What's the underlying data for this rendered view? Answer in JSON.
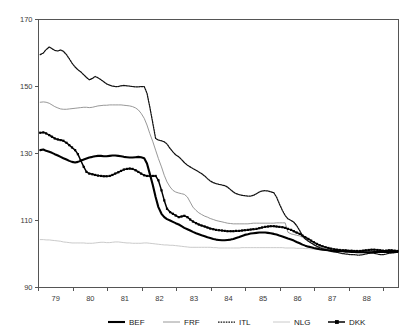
{
  "chart_data": {
    "type": "line",
    "title": "",
    "subtitle": "",
    "xlabel": "",
    "ylabel": "",
    "xlim": [
      78.5,
      88.92
    ],
    "ylim": [
      90,
      170
    ],
    "grid": false,
    "legend_position": "bottom",
    "y_ticks": [
      90,
      110,
      130,
      150,
      170
    ],
    "y_tick_labels": [
      "90",
      "110",
      "130",
      "150",
      "170"
    ],
    "x_ticks": [
      78.5,
      79.5,
      80.5,
      81.5,
      82.5,
      83.5,
      84.5,
      85.5,
      86.5,
      87.5,
      88.5
    ],
    "x_tick_labels": [
      "79",
      "80",
      "81",
      "82",
      "83",
      "84",
      "85",
      "86",
      "87",
      "88"
    ],
    "x": [
      78.55,
      78.64,
      78.72,
      78.81,
      78.89,
      78.97,
      79.06,
      79.14,
      79.22,
      79.31,
      79.39,
      79.47,
      79.56,
      79.64,
      79.72,
      79.81,
      79.89,
      79.97,
      80.06,
      80.14,
      80.22,
      80.31,
      80.39,
      80.47,
      80.56,
      80.64,
      80.72,
      80.81,
      80.89,
      80.97,
      81.06,
      81.14,
      81.22,
      81.31,
      81.39,
      81.47,
      81.56,
      81.64,
      81.72,
      81.81,
      81.89,
      81.97,
      82.06,
      82.14,
      82.22,
      82.31,
      82.39,
      82.47,
      82.56,
      82.64,
      82.72,
      82.81,
      82.89,
      82.97,
      83.06,
      83.14,
      83.22,
      83.31,
      83.39,
      83.47,
      83.56,
      83.64,
      83.72,
      83.81,
      83.89,
      83.97,
      84.06,
      84.14,
      84.22,
      84.31,
      84.39,
      84.47,
      84.56,
      84.64,
      84.72,
      84.81,
      84.89,
      84.97,
      85.06,
      85.14,
      85.22,
      85.31,
      85.39,
      85.47,
      85.56,
      85.64,
      85.72,
      85.81,
      85.89,
      85.97,
      86.06,
      86.14,
      86.22,
      86.31,
      86.39,
      86.47,
      86.56,
      86.64,
      86.72,
      86.81,
      86.89,
      86.97,
      87.06,
      87.14,
      87.22,
      87.31,
      87.39,
      87.47,
      87.56,
      87.64,
      87.72,
      87.81,
      87.89,
      87.97,
      88.06,
      88.14,
      88.22,
      88.31,
      88.39,
      88.47,
      88.56,
      88.64,
      88.72,
      88.81,
      88.89
    ],
    "series": [
      {
        "name": "BEF",
        "style": "solid-thick",
        "color": "#000000",
        "values": [
          131.0,
          131.2,
          130.8,
          130.5,
          130.2,
          129.8,
          129.4,
          129.0,
          128.6,
          128.2,
          127.8,
          127.5,
          127.3,
          127.5,
          127.8,
          128.2,
          128.5,
          128.8,
          129.0,
          129.2,
          129.3,
          129.3,
          129.2,
          129.2,
          129.3,
          129.4,
          129.4,
          129.3,
          129.2,
          129.0,
          128.9,
          128.8,
          128.8,
          128.9,
          129.0,
          128.9,
          128.6,
          127.0,
          124.0,
          120.5,
          117.0,
          114.0,
          112.0,
          111.0,
          110.4,
          110.0,
          109.6,
          109.2,
          108.8,
          108.3,
          107.8,
          107.4,
          107.0,
          106.6,
          106.2,
          105.9,
          105.6,
          105.3,
          105.0,
          104.8,
          104.5,
          104.3,
          104.2,
          104.1,
          104.1,
          104.2,
          104.3,
          104.5,
          104.8,
          105.1,
          105.4,
          105.7,
          105.9,
          106.1,
          106.2,
          106.3,
          106.4,
          106.4,
          106.4,
          106.3,
          106.2,
          106.0,
          105.8,
          105.5,
          105.2,
          104.9,
          104.6,
          104.3,
          104.0,
          103.6,
          103.2,
          102.8,
          102.5,
          102.2,
          102.0,
          101.8,
          101.6,
          101.4,
          101.3,
          101.2,
          101.1,
          101.0,
          100.9,
          100.9,
          100.8,
          100.8,
          100.7,
          100.7,
          100.6,
          100.6,
          100.5,
          100.5,
          100.5,
          100.5,
          100.5,
          100.5,
          100.6,
          100.6,
          100.6,
          100.6,
          100.6,
          100.6,
          100.6,
          100.6,
          100.6
        ]
      },
      {
        "name": "FRF",
        "style": "solid-medium",
        "color": "#8c8c8c",
        "values": [
          145.3,
          145.4,
          145.3,
          145.0,
          144.5,
          144.0,
          143.6,
          143.3,
          143.2,
          143.2,
          143.3,
          143.4,
          143.5,
          143.6,
          143.7,
          143.8,
          143.8,
          143.7,
          143.8,
          144.0,
          144.2,
          144.3,
          144.4,
          144.4,
          144.5,
          144.5,
          144.5,
          144.5,
          144.5,
          144.4,
          144.3,
          144.2,
          144.0,
          143.6,
          143.0,
          142.0,
          140.5,
          138.5,
          136.0,
          133.5,
          131.0,
          128.5,
          126.0,
          123.5,
          121.5,
          120.0,
          119.0,
          118.5,
          118.2,
          118.0,
          117.8,
          117.0,
          115.5,
          114.0,
          113.0,
          112.3,
          111.8,
          111.3,
          111.0,
          110.6,
          110.3,
          110.0,
          109.8,
          109.6,
          109.4,
          109.2,
          109.1,
          109.0,
          109.0,
          109.0,
          109.0,
          109.0,
          109.0,
          109.1,
          109.2,
          109.2,
          109.2,
          109.2,
          109.2,
          109.2,
          109.2,
          109.2,
          109.3,
          109.3,
          109.3,
          109.3,
          106.5,
          106.0,
          105.8,
          105.6,
          105.4,
          105.0,
          104.5,
          104.0,
          103.3,
          102.7,
          102.2,
          101.9,
          101.7,
          101.5,
          101.3,
          101.2,
          101.1,
          101.0,
          101.0,
          100.9,
          100.9,
          100.8,
          100.8,
          100.8,
          100.7,
          100.7,
          100.7,
          100.7,
          100.7,
          100.7,
          100.7,
          100.7,
          100.7,
          100.7,
          100.7,
          100.7,
          100.7,
          100.7,
          100.7
        ]
      },
      {
        "name": "ITL",
        "style": "dotted",
        "color": "#111111",
        "values": [
          159.5,
          160.0,
          161.0,
          161.8,
          161.3,
          160.8,
          160.6,
          160.9,
          160.5,
          159.5,
          158.3,
          157.0,
          155.8,
          155.0,
          154.4,
          153.5,
          152.7,
          152.0,
          152.4,
          153.0,
          152.6,
          152.0,
          151.4,
          150.8,
          150.4,
          150.1,
          150.0,
          150.0,
          150.2,
          150.3,
          150.2,
          150.1,
          150.0,
          149.9,
          149.9,
          150.0,
          150.0,
          148.0,
          144.0,
          139.0,
          134.5,
          134.0,
          133.8,
          133.5,
          132.8,
          131.5,
          130.5,
          129.6,
          129.0,
          128.2,
          127.3,
          126.5,
          126.0,
          125.5,
          125.0,
          124.5,
          124.0,
          123.3,
          122.5,
          121.8,
          121.3,
          121.0,
          120.8,
          120.6,
          120.4,
          120.0,
          119.2,
          118.5,
          118.0,
          117.7,
          117.5,
          117.4,
          117.3,
          117.3,
          117.5,
          118.0,
          118.5,
          118.8,
          118.9,
          118.8,
          118.6,
          118.3,
          117.0,
          115.0,
          113.0,
          111.5,
          110.5,
          110.0,
          109.5,
          108.5,
          107.0,
          105.5,
          104.5,
          103.8,
          103.3,
          102.8,
          102.3,
          101.9,
          101.5,
          101.2,
          101.0,
          100.8,
          100.6,
          100.5,
          100.3,
          100.1,
          100.0,
          99.9,
          99.8,
          99.8,
          99.7,
          99.7,
          99.8,
          100.0,
          100.2,
          100.3,
          100.2,
          100.0,
          99.8,
          99.8,
          100.0,
          100.2,
          100.3,
          100.4,
          100.5
        ]
      },
      {
        "name": "NLG",
        "style": "solid-light",
        "color": "#c4c4c4",
        "values": [
          104.3,
          104.3,
          104.2,
          104.2,
          104.1,
          104.0,
          103.9,
          103.8,
          103.6,
          103.5,
          103.4,
          103.3,
          103.3,
          103.3,
          103.3,
          103.3,
          103.2,
          103.2,
          103.2,
          103.3,
          103.4,
          103.5,
          103.5,
          103.4,
          103.4,
          103.5,
          103.6,
          103.6,
          103.5,
          103.4,
          103.3,
          103.3,
          103.2,
          103.2,
          103.2,
          103.2,
          103.3,
          103.3,
          103.2,
          103.1,
          103.0,
          102.9,
          102.8,
          102.7,
          102.7,
          102.6,
          102.6,
          102.5,
          102.4,
          102.3,
          102.2,
          102.1,
          102.0,
          102.0,
          102.0,
          102.0,
          102.0,
          102.0,
          102.0,
          102.0,
          101.9,
          101.9,
          101.8,
          101.8,
          101.8,
          101.8,
          101.8,
          101.8,
          101.8,
          101.8,
          101.9,
          101.9,
          101.9,
          101.9,
          101.9,
          101.9,
          101.9,
          101.9,
          101.9,
          101.9,
          101.9,
          101.9,
          101.9,
          101.9,
          101.9,
          101.8,
          101.8,
          101.8,
          101.8,
          101.7,
          101.7,
          101.7,
          101.6,
          101.6,
          101.5,
          101.4,
          101.4,
          101.3,
          101.3,
          101.2,
          101.2,
          101.1,
          101.1,
          101.0,
          101.0,
          100.9,
          100.9,
          100.9,
          100.8,
          100.8,
          100.8,
          100.8,
          100.8,
          100.8,
          100.8,
          100.8,
          100.8,
          100.8,
          100.8,
          100.8,
          100.8,
          100.8,
          100.8,
          100.8,
          100.8
        ]
      },
      {
        "name": "DKK",
        "style": "marker-square",
        "color": "#000000",
        "values": [
          136.2,
          136.3,
          136.0,
          135.5,
          135.0,
          134.5,
          134.2,
          134.0,
          133.8,
          133.2,
          132.5,
          131.8,
          131.0,
          129.8,
          128.0,
          126.0,
          124.5,
          124.0,
          123.8,
          123.6,
          123.4,
          123.3,
          123.2,
          123.2,
          123.3,
          123.6,
          124.0,
          124.4,
          124.8,
          125.2,
          125.4,
          125.5,
          125.4,
          125.0,
          124.5,
          124.0,
          123.5,
          123.3,
          123.3,
          123.3,
          123.3,
          122.0,
          119.0,
          116.0,
          113.5,
          112.5,
          112.0,
          111.5,
          111.0,
          111.2,
          111.4,
          111.0,
          110.3,
          109.7,
          109.2,
          108.8,
          108.5,
          108.2,
          107.9,
          107.6,
          107.4,
          107.2,
          107.1,
          107.0,
          106.9,
          106.8,
          106.8,
          106.8,
          106.9,
          106.9,
          107.0,
          107.1,
          107.2,
          107.3,
          107.4,
          107.5,
          107.7,
          107.9,
          108.1,
          108.2,
          108.3,
          108.3,
          108.2,
          108.1,
          108.0,
          107.8,
          107.5,
          107.2,
          106.8,
          106.4,
          106.0,
          105.5,
          105.0,
          104.5,
          104.0,
          103.5,
          103.0,
          102.6,
          102.3,
          102.0,
          101.8,
          101.6,
          101.4,
          101.3,
          101.2,
          101.1,
          101.1,
          101.0,
          101.0,
          100.9,
          100.9,
          100.9,
          101.0,
          101.1,
          101.2,
          101.3,
          101.3,
          101.2,
          101.1,
          101.0,
          101.0,
          101.1,
          101.1,
          101.0,
          100.9
        ]
      }
    ],
    "legend": [
      {
        "label": "BEF",
        "style": "solid-thick",
        "color": "#000000"
      },
      {
        "label": "FRF",
        "style": "solid-medium",
        "color": "#8c8c8c"
      },
      {
        "label": "ITL",
        "style": "dotted",
        "color": "#111111"
      },
      {
        "label": "NLG",
        "style": "solid-light",
        "color": "#c4c4c4"
      },
      {
        "label": "DKK",
        "style": "marker-square",
        "color": "#000000"
      }
    ]
  }
}
